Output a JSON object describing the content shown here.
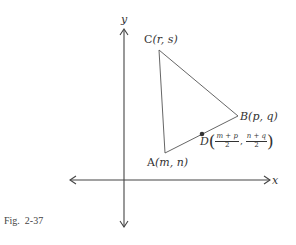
{
  "figure": {
    "caption_prefix": "Fig.",
    "caption_number": "2-37"
  },
  "axes": {
    "x_label": "x",
    "y_label": "y",
    "origin_px": [
      124,
      180
    ]
  },
  "points": {
    "A": {
      "name": "A",
      "coords": "(m, n)",
      "px": [
        165,
        153
      ]
    },
    "B": {
      "name": "B",
      "coords": "(p, q)",
      "px": [
        238,
        116
      ]
    },
    "C": {
      "name": "C",
      "coords": "(r, s)",
      "px": [
        159,
        50
      ]
    },
    "D": {
      "name": "D",
      "px": [
        202,
        134
      ],
      "x_num": "m + p",
      "x_den": "2",
      "y_num": "n + q",
      "y_den": "2",
      "sep": ",",
      "open": "(",
      "close": ")"
    }
  },
  "colors": {
    "line": "#555555",
    "text": "#333333",
    "dot": "#333333"
  }
}
